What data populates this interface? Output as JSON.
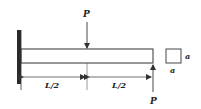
{
  "diagram": {
    "loads": [
      {
        "label": "P",
        "position": "mid-span",
        "direction": "down"
      },
      {
        "label": "P",
        "position": "free-end",
        "direction": "up"
      }
    ],
    "dimensions": [
      {
        "label": "L/2",
        "segment": "fixed-to-mid"
      },
      {
        "label": "L/2",
        "segment": "mid-to-end"
      }
    ],
    "cross_section": {
      "shape": "square",
      "width_label": "a",
      "height_label": "a"
    },
    "colors": {
      "line": "#333333",
      "wall": "#2a2a2a"
    }
  }
}
